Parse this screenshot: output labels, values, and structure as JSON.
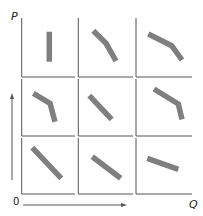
{
  "diagram": {
    "y_axis_label": "P",
    "x_axis_label": "Q",
    "origin_label": "0",
    "colors": {
      "curve": "#7f7f7f",
      "axis": "#555555",
      "background": "#ffffff"
    },
    "grid": {
      "rows": 3,
      "cols": 3
    },
    "panels": [
      {
        "row": 1,
        "col": 1,
        "shape": "vertical",
        "points": [
          [
            49.3,
            31.7
          ],
          [
            49.3,
            61.7
          ]
        ]
      },
      {
        "row": 1,
        "col": 2,
        "shape": "concave-down-steepening",
        "points": [
          [
            93.3,
            30.7
          ],
          [
            106,
            43.3
          ],
          [
            116,
            61
          ]
        ]
      },
      {
        "row": 1,
        "col": 3,
        "shape": "concave-down-steepening",
        "points": [
          [
            148.3,
            34
          ],
          [
            171.7,
            45.7
          ],
          [
            182,
            60
          ]
        ]
      },
      {
        "row": 2,
        "col": 1,
        "shape": "kinked-steepening",
        "points": [
          [
            33.3,
            93.3
          ],
          [
            50,
            103.3
          ],
          [
            55,
            121.7
          ]
        ]
      },
      {
        "row": 2,
        "col": 2,
        "shape": "linear-downward",
        "points": [
          [
            89.3,
            95.7
          ],
          [
            111.7,
            119.3
          ]
        ]
      },
      {
        "row": 2,
        "col": 3,
        "shape": "kinked-steepening",
        "points": [
          [
            154,
            89
          ],
          [
            178.3,
            104
          ],
          [
            182,
            119.3
          ]
        ]
      },
      {
        "row": 3,
        "col": 1,
        "shape": "linear-downward-steep",
        "points": [
          [
            32.3,
            147.7
          ],
          [
            61.3,
            178.3
          ]
        ]
      },
      {
        "row": 3,
        "col": 2,
        "shape": "linear-downward",
        "points": [
          [
            92.3,
            156.7
          ],
          [
            120.7,
            178.3
          ]
        ]
      },
      {
        "row": 3,
        "col": 3,
        "shape": "linear-downward-flat",
        "points": [
          [
            147.3,
            158.3
          ],
          [
            178.3,
            169.3
          ]
        ]
      }
    ]
  }
}
